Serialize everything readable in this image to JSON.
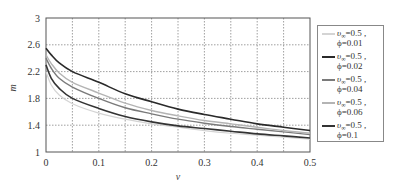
{
  "chart_data": {
    "type": "line",
    "title": "",
    "xlabel": "v",
    "ylabel": "m",
    "xlim": [
      0,
      0.5
    ],
    "ylim": [
      1,
      3
    ],
    "grid": true,
    "legend_position": "right",
    "x_ticks": [
      "0",
      "0.1",
      "0.2",
      "0.3",
      "0.4",
      "0.5"
    ],
    "y_ticks": [
      "1",
      "1.4",
      "1.8",
      "2.2",
      "2.6",
      "3"
    ],
    "x": [
      0,
      0.01,
      0.025,
      0.05,
      0.1,
      0.15,
      0.2,
      0.25,
      0.3,
      0.35,
      0.4,
      0.45,
      0.5
    ],
    "series": [
      {
        "name": "υ∞=0.5, ϕ=0.01",
        "color": "#d4d4d4",
        "width": 1.2,
        "values": [
          2.2,
          2.0,
          1.85,
          1.72,
          1.58,
          1.49,
          1.42,
          1.37,
          1.32,
          1.28,
          1.25,
          1.22,
          1.19
        ]
      },
      {
        "name": "υ∞=0.5, ϕ=0.02",
        "color": "#2a2a2a",
        "width": 1.6,
        "values": [
          2.55,
          2.45,
          2.33,
          2.2,
          2.04,
          1.87,
          1.75,
          1.64,
          1.56,
          1.49,
          1.42,
          1.37,
          1.32
        ]
      },
      {
        "name": "υ∞=0.5, ϕ=0.04",
        "color": "#7a7a7a",
        "width": 1.4,
        "values": [
          2.4,
          2.25,
          2.1,
          1.97,
          1.8,
          1.66,
          1.57,
          1.49,
          1.43,
          1.38,
          1.34,
          1.3,
          1.26
        ]
      },
      {
        "name": "υ∞=0.5, ϕ=0.06",
        "color": "#b4b4b4",
        "width": 1.4,
        "values": [
          2.45,
          2.32,
          2.18,
          2.04,
          1.88,
          1.73,
          1.62,
          1.54,
          1.47,
          1.42,
          1.37,
          1.32,
          1.28
        ]
      },
      {
        "name": "υ∞=0.5, ϕ=0.1",
        "color": "#333333",
        "width": 1.6,
        "values": [
          2.3,
          2.1,
          1.95,
          1.8,
          1.65,
          1.53,
          1.45,
          1.39,
          1.35,
          1.31,
          1.27,
          1.24,
          1.21
        ]
      }
    ]
  },
  "legend": {
    "items": [
      {
        "line1_prefix": "υ",
        "line1_sub": "∞",
        "line1_suffix": "=0.5 ,",
        "line2": "ϕ=0.01",
        "color": "#d4d4d4"
      },
      {
        "line1_prefix": "υ",
        "line1_sub": "∞",
        "line1_suffix": "=0.5 ,",
        "line2": "ϕ=0.02",
        "color": "#2a2a2a"
      },
      {
        "line1_prefix": "υ",
        "line1_sub": "∞",
        "line1_suffix": "=0.5 ,",
        "line2": "ϕ=0.04",
        "color": "#7a7a7a"
      },
      {
        "line1_prefix": "υ",
        "line1_sub": "∞",
        "line1_suffix": "=0.5 ,",
        "line2": "ϕ=0.06",
        "color": "#b4b4b4"
      },
      {
        "line1_prefix": "υ",
        "line1_sub": "∞",
        "line1_suffix": "=0.5 ,",
        "line2": "ϕ=0.1",
        "color": "#333333"
      }
    ]
  }
}
